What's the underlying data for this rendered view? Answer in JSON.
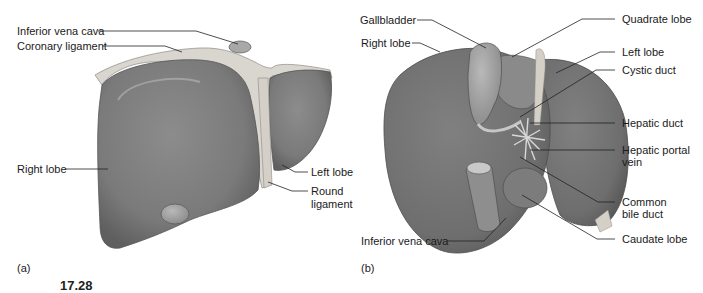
{
  "figure": {
    "number_partial": "17.28",
    "panels": [
      {
        "id": "a",
        "letter": "(a)",
        "view": "anterior view of liver",
        "labels": {
          "inferior_vena_cava": "Inferior vena cava",
          "coronary_ligament": "Coronary ligament",
          "right_lobe": "Right lobe",
          "left_lobe": "Left lobe",
          "round_ligament_1": "Round",
          "round_ligament_2": "ligament"
        }
      },
      {
        "id": "b",
        "letter": "(b)",
        "view": "inferior view of liver",
        "labels": {
          "gallbladder": "Gallbladder",
          "right_lobe": "Right lobe",
          "quadrate_lobe": "Quadrate lobe",
          "left_lobe": "Left lobe",
          "cystic_duct": "Cystic duct",
          "hepatic_duct": "Hepatic duct",
          "hepatic_portal_vein_1": "Hepatic portal",
          "hepatic_portal_vein_2": "vein",
          "common_bile_duct_1": "Common",
          "common_bile_duct_2": "bile duct",
          "caudate_lobe": "Caudate lobe",
          "inferior_vena_cava": "Inferior vena cava"
        }
      }
    ]
  },
  "colors": {
    "organ": "#7a7a7a",
    "organ_dark": "#5e5e5e",
    "organ_light": "#9a9a9a",
    "ligament": "#d9d6cf",
    "leader": "#222222",
    "text": "#1a1a1a"
  }
}
